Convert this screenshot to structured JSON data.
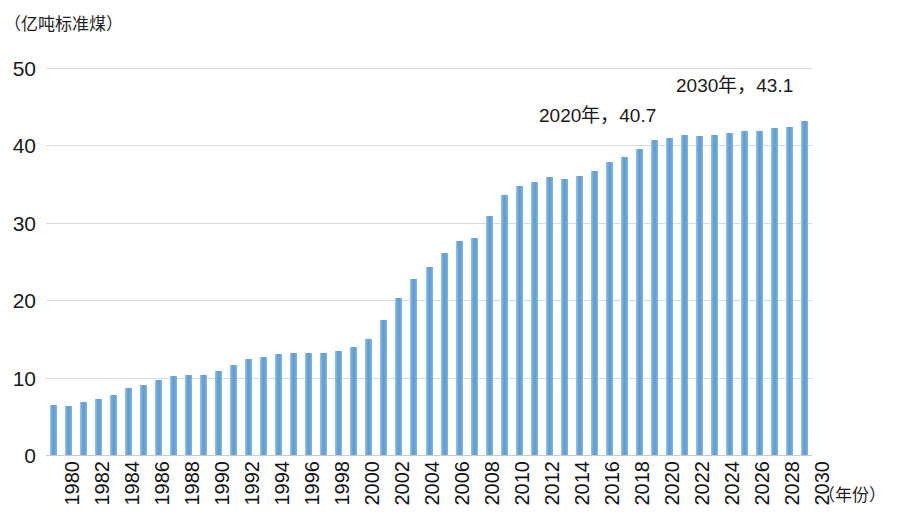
{
  "chart_data": {
    "type": "bar",
    "title": "",
    "subtitle": "",
    "unit_label": "（亿吨标准煤）",
    "ylabel": "",
    "xlabel": "（年份）",
    "ylim": [
      0,
      50
    ],
    "yticks": [
      0,
      10,
      20,
      30,
      40,
      50
    ],
    "grid": true,
    "legend": "none",
    "bar_color": "#5B9BD5",
    "x_tick_step": 2,
    "categories": [
      "1980",
      "1981",
      "1982",
      "1983",
      "1984",
      "1985",
      "1986",
      "1987",
      "1988",
      "1989",
      "1990",
      "1991",
      "1992",
      "1993",
      "1994",
      "1995",
      "1996",
      "1997",
      "1998",
      "1999",
      "2000",
      "2001",
      "2002",
      "2003",
      "2004",
      "2005",
      "2006",
      "2007",
      "2008",
      "2009",
      "2010",
      "2011",
      "2012",
      "2013",
      "2014",
      "2015",
      "2016",
      "2017",
      "2018",
      "2019",
      "2020",
      "2021",
      "2022",
      "2023",
      "2024",
      "2025",
      "2026",
      "2027",
      "2028",
      "2029",
      "2030"
    ],
    "values": [
      6.4,
      6.3,
      6.8,
      7.2,
      7.8,
      8.6,
      9.0,
      9.7,
      10.2,
      10.4,
      10.4,
      10.9,
      11.6,
      12.4,
      12.7,
      13.1,
      13.2,
      13.2,
      13.2,
      13.4,
      13.9,
      15.0,
      17.5,
      20.3,
      22.8,
      24.3,
      26.1,
      27.6,
      28.1,
      30.9,
      33.6,
      34.8,
      35.3,
      35.9,
      35.7,
      36.1,
      36.7,
      37.9,
      38.5,
      39.6,
      40.7,
      41.0,
      41.3,
      41.2,
      41.4,
      41.6,
      41.8,
      41.9,
      42.2,
      42.4,
      43.1
    ],
    "annotations": [
      {
        "id": "a2030",
        "text": "2030年，43.1",
        "year": "2030",
        "value": 43.1
      },
      {
        "id": "a2020",
        "text": "2020年，40.7",
        "year": "2020",
        "value": 40.7
      }
    ]
  }
}
